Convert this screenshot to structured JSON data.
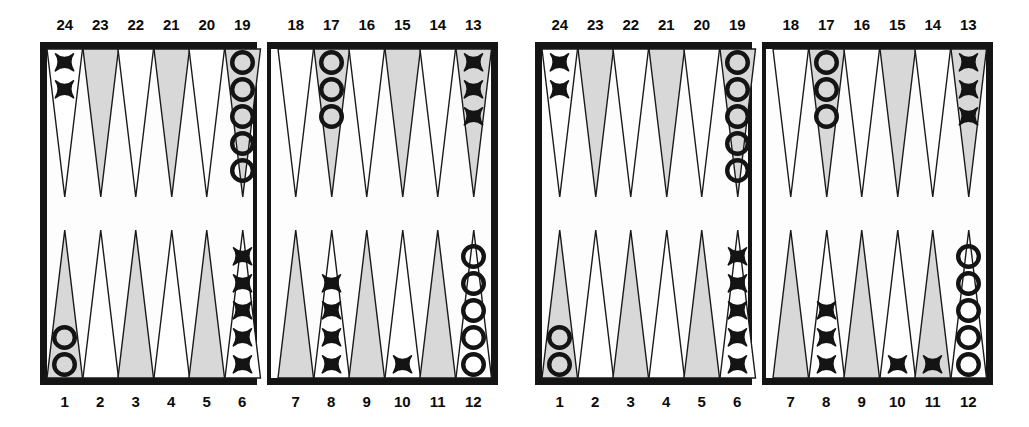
{
  "figure": {
    "type": "backgammon-position-pair",
    "board_count": 2
  },
  "labels": {
    "top_numbers_left_quadrant": [
      "24",
      "23",
      "22",
      "21",
      "20",
      "19"
    ],
    "top_numbers_right_quadrant": [
      "18",
      "17",
      "16",
      "15",
      "14",
      "13"
    ],
    "bottom_numbers_left_quadrant": [
      "1",
      "2",
      "3",
      "4",
      "5",
      "6"
    ],
    "bottom_numbers_right_quadrant": [
      "7",
      "8",
      "9",
      "10",
      "11",
      "12"
    ]
  },
  "colors": {
    "board_border": "#141414",
    "point_shaded": "#d8d8d8",
    "point_light": "#ffffff",
    "checker_outline": "#141414",
    "page_background": "#ffffff",
    "label_text": "#0c0c0c"
  },
  "boards": [
    {
      "name": "left-board",
      "top_left_quadrant": [
        {
          "point": "24",
          "shaded": false,
          "checker": "X",
          "count": 2
        },
        {
          "point": "23",
          "shaded": true,
          "checker": null,
          "count": 0
        },
        {
          "point": "22",
          "shaded": false,
          "checker": null,
          "count": 0
        },
        {
          "point": "21",
          "shaded": true,
          "checker": null,
          "count": 0
        },
        {
          "point": "20",
          "shaded": false,
          "checker": null,
          "count": 0
        },
        {
          "point": "19",
          "shaded": true,
          "checker": "O",
          "count": 5
        }
      ],
      "top_right_quadrant": [
        {
          "point": "18",
          "shaded": false,
          "checker": null,
          "count": 0
        },
        {
          "point": "17",
          "shaded": true,
          "checker": "O",
          "count": 3
        },
        {
          "point": "16",
          "shaded": false,
          "checker": null,
          "count": 0
        },
        {
          "point": "15",
          "shaded": true,
          "checker": null,
          "count": 0
        },
        {
          "point": "14",
          "shaded": false,
          "checker": null,
          "count": 0
        },
        {
          "point": "13",
          "shaded": true,
          "checker": "X",
          "count": 3
        }
      ],
      "bottom_left_quadrant": [
        {
          "point": "1",
          "shaded": true,
          "checker": "O",
          "count": 2
        },
        {
          "point": "2",
          "shaded": false,
          "checker": null,
          "count": 0
        },
        {
          "point": "3",
          "shaded": true,
          "checker": null,
          "count": 0
        },
        {
          "point": "4",
          "shaded": false,
          "checker": null,
          "count": 0
        },
        {
          "point": "5",
          "shaded": true,
          "checker": null,
          "count": 0
        },
        {
          "point": "6",
          "shaded": false,
          "checker": "X",
          "count": 5
        }
      ],
      "bottom_right_quadrant": [
        {
          "point": "7",
          "shaded": true,
          "checker": null,
          "count": 0
        },
        {
          "point": "8",
          "shaded": false,
          "checker": "X",
          "count": 4
        },
        {
          "point": "9",
          "shaded": true,
          "checker": null,
          "count": 0
        },
        {
          "point": "10",
          "shaded": false,
          "checker": "X",
          "count": 1
        },
        {
          "point": "11",
          "shaded": true,
          "checker": null,
          "count": 0
        },
        {
          "point": "12",
          "shaded": false,
          "checker": "O",
          "count": 5
        }
      ]
    },
    {
      "name": "right-board",
      "top_left_quadrant": [
        {
          "point": "24",
          "shaded": false,
          "checker": "X",
          "count": 2
        },
        {
          "point": "23",
          "shaded": true,
          "checker": null,
          "count": 0
        },
        {
          "point": "22",
          "shaded": false,
          "checker": null,
          "count": 0
        },
        {
          "point": "21",
          "shaded": true,
          "checker": null,
          "count": 0
        },
        {
          "point": "20",
          "shaded": false,
          "checker": null,
          "count": 0
        },
        {
          "point": "19",
          "shaded": true,
          "checker": "O",
          "count": 5
        }
      ],
      "top_right_quadrant": [
        {
          "point": "18",
          "shaded": false,
          "checker": null,
          "count": 0
        },
        {
          "point": "17",
          "shaded": true,
          "checker": "O",
          "count": 3
        },
        {
          "point": "16",
          "shaded": false,
          "checker": null,
          "count": 0
        },
        {
          "point": "15",
          "shaded": true,
          "checker": null,
          "count": 0
        },
        {
          "point": "14",
          "shaded": false,
          "checker": null,
          "count": 0
        },
        {
          "point": "13",
          "shaded": true,
          "checker": "X",
          "count": 3
        }
      ],
      "bottom_left_quadrant": [
        {
          "point": "1",
          "shaded": true,
          "checker": "O",
          "count": 2
        },
        {
          "point": "2",
          "shaded": false,
          "checker": null,
          "count": 0
        },
        {
          "point": "3",
          "shaded": true,
          "checker": null,
          "count": 0
        },
        {
          "point": "4",
          "shaded": false,
          "checker": null,
          "count": 0
        },
        {
          "point": "5",
          "shaded": true,
          "checker": null,
          "count": 0
        },
        {
          "point": "6",
          "shaded": false,
          "checker": "X",
          "count": 5
        }
      ],
      "bottom_right_quadrant": [
        {
          "point": "7",
          "shaded": true,
          "checker": null,
          "count": 0
        },
        {
          "point": "8",
          "shaded": false,
          "checker": "X",
          "count": 3
        },
        {
          "point": "9",
          "shaded": true,
          "checker": null,
          "count": 0
        },
        {
          "point": "10",
          "shaded": false,
          "checker": "X",
          "count": 1
        },
        {
          "point": "11",
          "shaded": true,
          "checker": "X",
          "count": 1
        },
        {
          "point": "12",
          "shaded": false,
          "checker": "O",
          "count": 5
        }
      ]
    }
  ]
}
